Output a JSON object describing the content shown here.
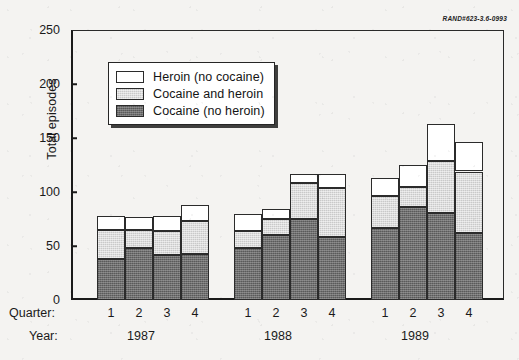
{
  "credit": "RAND#623-3.6-0993",
  "axis": {
    "ylabel": "Total episodes",
    "yticks": [
      "0",
      "50",
      "100",
      "150",
      "200",
      "250"
    ],
    "quarter_row_label": "Quarter:",
    "year_row_label": "Year:"
  },
  "legend": {
    "items": [
      {
        "label": "Heroin (no cocaine)",
        "swatch": "white"
      },
      {
        "label": "Cocaine and heroin",
        "swatch": "light-gray"
      },
      {
        "label": "Cocaine (no heroin)",
        "swatch": "dark-gray"
      }
    ]
  },
  "colors": {
    "heroin_no_cocaine": "#ffffff",
    "cocaine_and_heroin": "#c9c9c9",
    "cocaine_no_heroin": "#6e6e6e",
    "outline": "#2b2b2b",
    "background": "#f4f3f1"
  },
  "chart_data": {
    "type": "bar",
    "stacked": true,
    "title": "",
    "xlabel": "",
    "ylabel": "Total episodes",
    "ylim": [
      0,
      250
    ],
    "ytick_step": 50,
    "grid": false,
    "legend_position": "upper-left-inside",
    "categories": [
      "1987 Q1",
      "1987 Q2",
      "1987 Q3",
      "1987 Q4",
      "1988 Q1",
      "1988 Q2",
      "1988 Q3",
      "1988 Q4",
      "1989 Q1",
      "1989 Q2",
      "1989 Q3",
      "1989 Q4"
    ],
    "quarters": [
      "1",
      "2",
      "3",
      "4",
      "1",
      "2",
      "3",
      "4",
      "1",
      "2",
      "3",
      "4"
    ],
    "years": [
      "1987",
      "1988",
      "1989"
    ],
    "series": [
      {
        "name": "Cocaine (no heroin)",
        "values": [
          38,
          48,
          42,
          43,
          48,
          60,
          75,
          58,
          67,
          86,
          81,
          62
        ]
      },
      {
        "name": "Cocaine and heroin",
        "values": [
          27,
          17,
          22,
          30,
          16,
          15,
          33,
          46,
          29,
          19,
          48,
          57
        ]
      },
      {
        "name": "Heroin (no cocaine)",
        "values": [
          13,
          12,
          14,
          15,
          16,
          9,
          9,
          13,
          17,
          20,
          34,
          27
        ]
      }
    ],
    "totals": [
      78,
      77,
      78,
      88,
      80,
      84,
      117,
      117,
      113,
      125,
      163,
      146
    ]
  },
  "layout": {
    "bar_x": [
      26,
      54,
      82,
      110,
      163,
      191,
      219,
      247,
      300,
      328,
      356,
      384
    ],
    "bar_width": 28,
    "year_centers_px": [
      141,
      278,
      415
    ],
    "quarter_centers_px": [
      111,
      139,
      167,
      195,
      248,
      276,
      304,
      332,
      385,
      413,
      441,
      469
    ]
  }
}
